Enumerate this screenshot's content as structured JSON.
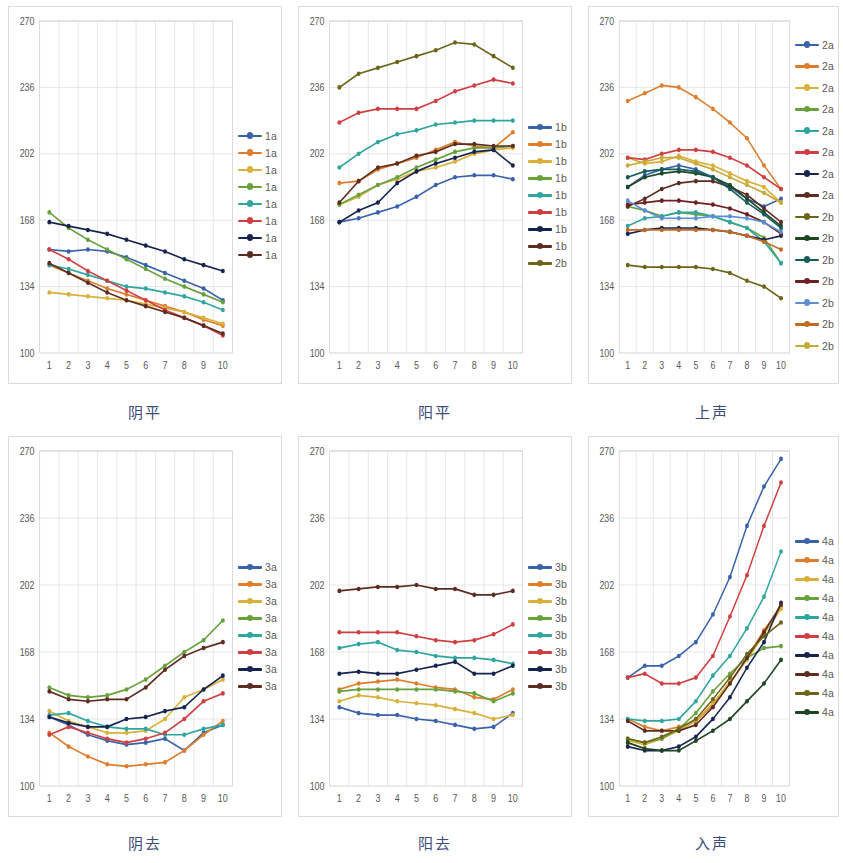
{
  "figure": {
    "panel_count": 6,
    "y_ticks": [
      100,
      134,
      168,
      202,
      236,
      270
    ],
    "x_ticks": [
      "1",
      "2",
      "3",
      "4",
      "5",
      "6",
      "7",
      "8",
      "9",
      "10"
    ],
    "palette": {
      "blue": "#3a62ab",
      "orange": "#de7d2b",
      "gold": "#d9b03a",
      "green": "#68a03c",
      "teal": "#2fa5a0",
      "red": "#cf3f42",
      "navy": "#16244e",
      "darkbrown": "#5c2c21",
      "olive": "#6d6419",
      "darkgreen": "#1d4423",
      "darkteal": "#145c57",
      "darkred": "#6e1f21",
      "lightblue": "#5b8fd4",
      "orange2": "#c06a24",
      "gold2": "#c9a83a"
    }
  },
  "chart_data": [
    {
      "type": "line",
      "title": "阴平",
      "panel_index": 1,
      "xlabel": "",
      "ylabel": "",
      "x": [
        1,
        2,
        3,
        4,
        5,
        6,
        7,
        8,
        9,
        10
      ],
      "xlim": [
        1,
        10
      ],
      "ylim": [
        100,
        270
      ],
      "grid": true,
      "legend_position": "right",
      "series": [
        {
          "name": "1a",
          "color": "blue",
          "values": [
            153,
            152,
            153,
            152,
            149,
            145,
            141,
            137,
            133,
            127
          ]
        },
        {
          "name": "1a",
          "color": "orange",
          "values": [
            145,
            141,
            137,
            133,
            130,
            127,
            124,
            121,
            117,
            114
          ]
        },
        {
          "name": "1a",
          "color": "gold",
          "values": [
            131,
            130,
            129,
            128,
            127,
            125,
            123,
            121,
            118,
            115
          ]
        },
        {
          "name": "1a",
          "color": "green",
          "values": [
            172,
            164,
            158,
            153,
            148,
            143,
            138,
            134,
            130,
            126
          ]
        },
        {
          "name": "1a",
          "color": "teal",
          "values": [
            145,
            143,
            140,
            137,
            134,
            133,
            131,
            129,
            126,
            122
          ]
        },
        {
          "name": "1a",
          "color": "red",
          "values": [
            153,
            148,
            142,
            137,
            132,
            127,
            122,
            118,
            114,
            109
          ]
        },
        {
          "name": "1a",
          "color": "navy",
          "values": [
            167,
            165,
            163,
            161,
            158,
            155,
            152,
            148,
            145,
            142
          ]
        },
        {
          "name": "1a",
          "color": "darkbrown",
          "values": [
            146,
            141,
            136,
            131,
            127,
            124,
            121,
            118,
            114,
            110
          ]
        }
      ]
    },
    {
      "type": "line",
      "title": "阳平",
      "panel_index": 2,
      "xlabel": "",
      "ylabel": "",
      "x": [
        1,
        2,
        3,
        4,
        5,
        6,
        7,
        8,
        9,
        10
      ],
      "xlim": [
        1,
        10
      ],
      "ylim": [
        100,
        270
      ],
      "grid": true,
      "legend_position": "right",
      "series": [
        {
          "name": "1b",
          "color": "blue",
          "values": [
            167,
            169,
            172,
            175,
            180,
            186,
            190,
            191,
            191,
            189
          ]
        },
        {
          "name": "1b",
          "color": "orange",
          "values": [
            187,
            188,
            194,
            197,
            200,
            204,
            208,
            206,
            205,
            213
          ]
        },
        {
          "name": "1b",
          "color": "gold",
          "values": [
            176,
            180,
            186,
            189,
            193,
            195,
            198,
            202,
            204,
            205
          ]
        },
        {
          "name": "1b",
          "color": "green",
          "values": [
            176,
            181,
            186,
            190,
            195,
            199,
            203,
            205,
            205,
            206
          ]
        },
        {
          "name": "1b",
          "color": "teal",
          "values": [
            195,
            202,
            208,
            212,
            214,
            217,
            218,
            219,
            219,
            219
          ]
        },
        {
          "name": "1b",
          "color": "red",
          "values": [
            218,
            223,
            225,
            225,
            225,
            229,
            234,
            237,
            240,
            238
          ]
        },
        {
          "name": "1b",
          "color": "navy",
          "values": [
            167,
            173,
            177,
            187,
            193,
            197,
            200,
            203,
            204,
            196
          ]
        },
        {
          "name": "1b",
          "color": "darkbrown",
          "values": [
            177,
            188,
            195,
            197,
            201,
            203,
            207,
            207,
            206,
            206
          ]
        },
        {
          "name": "2b",
          "color": "olive",
          "values": [
            236,
            243,
            246,
            249,
            252,
            255,
            259,
            258,
            252,
            246
          ]
        }
      ]
    },
    {
      "type": "line",
      "title": "上声",
      "panel_index": 3,
      "xlabel": "",
      "ylabel": "",
      "x": [
        1,
        2,
        3,
        4,
        5,
        6,
        7,
        8,
        9,
        10
      ],
      "xlim": [
        1,
        10
      ],
      "ylim": [
        100,
        270
      ],
      "grid": true,
      "legend_position": "right",
      "series": [
        {
          "name": "2a",
          "color": "blue",
          "values": [
            185,
            191,
            194,
            196,
            194,
            190,
            185,
            179,
            175,
            179
          ]
        },
        {
          "name": "2a",
          "color": "orange",
          "values": [
            229,
            233,
            237,
            236,
            231,
            225,
            218,
            210,
            196,
            184
          ]
        },
        {
          "name": "2a",
          "color": "gold",
          "values": [
            200,
            197,
            198,
            201,
            198,
            196,
            192,
            188,
            185,
            177
          ]
        },
        {
          "name": "2a",
          "color": "green",
          "values": [
            175,
            173,
            170,
            172,
            171,
            170,
            167,
            164,
            159,
            146
          ]
        },
        {
          "name": "2a",
          "color": "teal",
          "values": [
            165,
            169,
            170,
            172,
            172,
            170,
            167,
            164,
            157,
            146
          ]
        },
        {
          "name": "2a",
          "color": "red",
          "values": [
            200,
            199,
            202,
            204,
            204,
            203,
            200,
            196,
            190,
            184
          ]
        },
        {
          "name": "2a",
          "color": "navy",
          "values": [
            161,
            163,
            164,
            164,
            164,
            163,
            162,
            160,
            158,
            160
          ]
        },
        {
          "name": "2a",
          "color": "darkbrown",
          "values": [
            175,
            179,
            184,
            187,
            188,
            188,
            185,
            181,
            174,
            167
          ]
        },
        {
          "name": "2b",
          "color": "olive",
          "values": [
            145,
            144,
            144,
            144,
            144,
            143,
            141,
            137,
            134,
            128
          ]
        },
        {
          "name": "2b",
          "color": "darkgreen",
          "values": [
            185,
            190,
            192,
            193,
            192,
            190,
            186,
            179,
            172,
            165
          ]
        },
        {
          "name": "2b",
          "color": "darkteal",
          "values": [
            190,
            193,
            194,
            194,
            193,
            190,
            184,
            177,
            171,
            164
          ]
        },
        {
          "name": "2b",
          "color": "darkred",
          "values": [
            176,
            177,
            178,
            178,
            177,
            176,
            174,
            171,
            167,
            161
          ]
        },
        {
          "name": "2b",
          "color": "lightblue",
          "values": [
            178,
            173,
            169,
            169,
            169,
            170,
            170,
            169,
            167,
            162
          ]
        },
        {
          "name": "2b",
          "color": "orange2",
          "values": [
            163,
            163,
            163,
            163,
            163,
            163,
            162,
            160,
            157,
            153
          ]
        },
        {
          "name": "2b",
          "color": "gold2",
          "values": [
            196,
            198,
            200,
            200,
            197,
            194,
            190,
            186,
            182,
            177
          ]
        }
      ]
    },
    {
      "type": "line",
      "title": "阴去",
      "panel_index": 4,
      "xlabel": "",
      "ylabel": "",
      "x": [
        1,
        2,
        3,
        4,
        5,
        6,
        7,
        8,
        9,
        10
      ],
      "xlim": [
        1,
        10
      ],
      "ylim": [
        100,
        270
      ],
      "grid": true,
      "legend_position": "right",
      "series": [
        {
          "name": "3a",
          "color": "blue",
          "values": [
            135,
            131,
            126,
            123,
            121,
            122,
            124,
            118,
            127,
            131
          ]
        },
        {
          "name": "3a",
          "color": "orange",
          "values": [
            127,
            120,
            115,
            111,
            110,
            111,
            112,
            118,
            126,
            133
          ]
        },
        {
          "name": "3a",
          "color": "gold",
          "values": [
            138,
            133,
            130,
            127,
            127,
            128,
            134,
            145,
            149,
            154
          ]
        },
        {
          "name": "3a",
          "color": "green",
          "values": [
            150,
            146,
            145,
            146,
            149,
            154,
            161,
            168,
            174,
            184
          ]
        },
        {
          "name": "3a",
          "color": "teal",
          "values": [
            136,
            137,
            133,
            130,
            129,
            129,
            126,
            126,
            129,
            131
          ]
        },
        {
          "name": "3a",
          "color": "red",
          "values": [
            126,
            130,
            127,
            124,
            122,
            124,
            127,
            134,
            143,
            147
          ]
        },
        {
          "name": "3a",
          "color": "navy",
          "values": [
            135,
            132,
            130,
            130,
            134,
            135,
            138,
            140,
            149,
            156
          ]
        },
        {
          "name": "3a",
          "color": "darkbrown",
          "values": [
            148,
            144,
            143,
            144,
            144,
            150,
            159,
            166,
            170,
            173
          ]
        }
      ]
    },
    {
      "type": "line",
      "title": "阳去",
      "panel_index": 5,
      "xlabel": "",
      "ylabel": "",
      "x": [
        1,
        2,
        3,
        4,
        5,
        6,
        7,
        8,
        9,
        10
      ],
      "xlim": [
        1,
        10
      ],
      "ylim": [
        100,
        270
      ],
      "grid": true,
      "legend_position": "right",
      "series": [
        {
          "name": "3b",
          "color": "blue",
          "values": [
            140,
            137,
            136,
            136,
            134,
            133,
            131,
            129,
            130,
            137
          ]
        },
        {
          "name": "3b",
          "color": "orange",
          "values": [
            149,
            152,
            153,
            154,
            152,
            150,
            149,
            145,
            144,
            149
          ]
        },
        {
          "name": "3b",
          "color": "gold",
          "values": [
            143,
            146,
            145,
            143,
            142,
            141,
            139,
            137,
            134,
            136
          ]
        },
        {
          "name": "3b",
          "color": "green",
          "values": [
            148,
            149,
            149,
            149,
            149,
            149,
            148,
            147,
            143,
            147
          ]
        },
        {
          "name": "3b",
          "color": "teal",
          "values": [
            170,
            172,
            173,
            169,
            168,
            166,
            165,
            165,
            164,
            162
          ]
        },
        {
          "name": "3b",
          "color": "red",
          "values": [
            178,
            178,
            178,
            178,
            176,
            174,
            173,
            174,
            177,
            182
          ]
        },
        {
          "name": "3b",
          "color": "navy",
          "values": [
            157,
            158,
            157,
            157,
            159,
            161,
            163,
            157,
            157,
            161
          ]
        },
        {
          "name": "3b",
          "color": "darkbrown",
          "values": [
            199,
            200,
            201,
            201,
            202,
            200,
            200,
            197,
            197,
            199
          ]
        }
      ]
    },
    {
      "type": "line",
      "title": "入声",
      "panel_index": 6,
      "xlabel": "",
      "ylabel": "",
      "x": [
        1,
        2,
        3,
        4,
        5,
        6,
        7,
        8,
        9,
        10
      ],
      "xlim": [
        1,
        10
      ],
      "ylim": [
        100,
        270
      ],
      "grid": true,
      "legend_position": "right",
      "series": [
        {
          "name": "4a",
          "color": "blue",
          "values": [
            155,
            161,
            161,
            166,
            173,
            187,
            206,
            232,
            252,
            266
          ]
        },
        {
          "name": "4a",
          "color": "orange",
          "values": [
            134,
            130,
            128,
            130,
            133,
            141,
            152,
            165,
            179,
            191
          ]
        },
        {
          "name": "4a",
          "color": "gold",
          "values": [
            123,
            121,
            124,
            128,
            133,
            142,
            153,
            164,
            177,
            190
          ]
        },
        {
          "name": "4a",
          "color": "green",
          "values": [
            124,
            122,
            124,
            129,
            137,
            148,
            157,
            165,
            170,
            171
          ]
        },
        {
          "name": "4a",
          "color": "teal",
          "values": [
            134,
            133,
            133,
            134,
            143,
            156,
            166,
            180,
            196,
            219
          ]
        },
        {
          "name": "4a",
          "color": "red",
          "values": [
            155,
            157,
            152,
            152,
            155,
            166,
            186,
            207,
            232,
            254
          ]
        },
        {
          "name": "4a",
          "color": "navy",
          "values": [
            120,
            118,
            118,
            120,
            125,
            134,
            145,
            160,
            173,
            193
          ]
        },
        {
          "name": "4a",
          "color": "darkbrown",
          "values": [
            133,
            128,
            128,
            128,
            131,
            140,
            152,
            165,
            178,
            192
          ]
        },
        {
          "name": "4a",
          "color": "olive",
          "values": [
            124,
            122,
            125,
            129,
            134,
            144,
            155,
            167,
            176,
            183
          ]
        },
        {
          "name": "4a",
          "color": "darkgreen",
          "values": [
            122,
            119,
            118,
            118,
            123,
            128,
            134,
            143,
            152,
            164
          ]
        }
      ]
    }
  ]
}
